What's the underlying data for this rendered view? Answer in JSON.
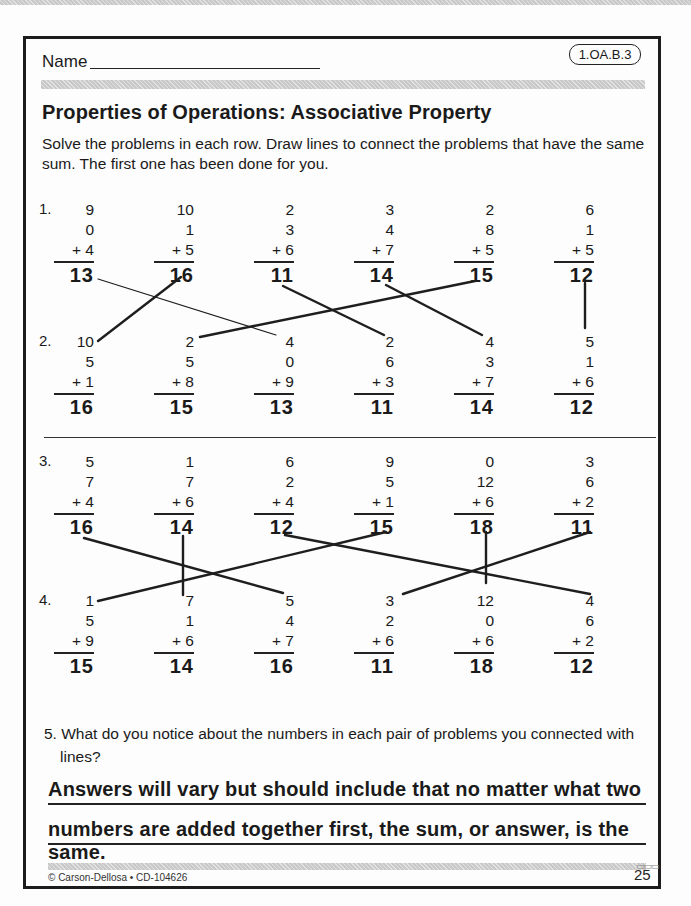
{
  "header": {
    "name_label": "Name",
    "standard_badge": "1.OA.B.3"
  },
  "title": "Properties of Operations: Associative Property",
  "instructions": {
    "line1": "Solve the problems in each row. Draw lines to connect the problems that have the same",
    "line2": "sum. The first one has been done for you."
  },
  "rows": [
    {
      "label": "1.",
      "problems": [
        {
          "a": "9",
          "b": "0",
          "c": "+ 4",
          "sum": "13"
        },
        {
          "a": "10",
          "b": "1",
          "c": "+ 5",
          "sum": "16"
        },
        {
          "a": "2",
          "b": "3",
          "c": "+ 6",
          "sum": "11"
        },
        {
          "a": "3",
          "b": "4",
          "c": "+ 7",
          "sum": "14"
        },
        {
          "a": "2",
          "b": "8",
          "c": "+ 5",
          "sum": "15"
        },
        {
          "a": "6",
          "b": "1",
          "c": "+ 5",
          "sum": "12"
        }
      ]
    },
    {
      "label": "2.",
      "problems": [
        {
          "a": "10",
          "b": "5",
          "c": "+ 1",
          "sum": "16"
        },
        {
          "a": "2",
          "b": "5",
          "c": "+ 8",
          "sum": "15"
        },
        {
          "a": "4",
          "b": "0",
          "c": "+ 9",
          "sum": "13"
        },
        {
          "a": "2",
          "b": "6",
          "c": "+ 3",
          "sum": "11"
        },
        {
          "a": "4",
          "b": "3",
          "c": "+ 7",
          "sum": "14"
        },
        {
          "a": "5",
          "b": "1",
          "c": "+ 6",
          "sum": "12"
        }
      ]
    },
    {
      "label": "3.",
      "problems": [
        {
          "a": "5",
          "b": "7",
          "c": "+ 4",
          "sum": "16"
        },
        {
          "a": "1",
          "b": "7",
          "c": "+ 6",
          "sum": "14"
        },
        {
          "a": "6",
          "b": "2",
          "c": "+ 4",
          "sum": "12"
        },
        {
          "a": "9",
          "b": "5",
          "c": "+ 1",
          "sum": "15"
        },
        {
          "a": "0",
          "b": "12",
          "c": "+ 6",
          "sum": "18"
        },
        {
          "a": "3",
          "b": "6",
          "c": "+ 2",
          "sum": "11"
        }
      ]
    },
    {
      "label": "4.",
      "problems": [
        {
          "a": "1",
          "b": "5",
          "c": "+ 9",
          "sum": "15"
        },
        {
          "a": "7",
          "b": "1",
          "c": "+ 6",
          "sum": "14"
        },
        {
          "a": "5",
          "b": "4",
          "c": "+ 7",
          "sum": "16"
        },
        {
          "a": "3",
          "b": "2",
          "c": "+ 6",
          "sum": "11"
        },
        {
          "a": "12",
          "b": "0",
          "c": "+ 6",
          "sum": "18"
        },
        {
          "a": "4",
          "b": "6",
          "c": "+ 2",
          "sum": "12"
        }
      ]
    }
  ],
  "connections": {
    "rows_1_2": [
      {
        "from": "13",
        "to": "13",
        "x1": 98,
        "y1": 279,
        "x2": 276,
        "y2": 335,
        "width": 1.2
      },
      {
        "from": "16",
        "to": "16",
        "x1": 181,
        "y1": 277,
        "x2": 98,
        "y2": 341,
        "width": 2.4
      },
      {
        "from": "11",
        "to": "11",
        "x1": 283,
        "y1": 286,
        "x2": 384,
        "y2": 335,
        "width": 2.4
      },
      {
        "from": "14",
        "to": "14",
        "x1": 386,
        "y1": 285,
        "x2": 482,
        "y2": 335,
        "width": 2.4
      },
      {
        "from": "15",
        "to": "15",
        "x1": 475,
        "y1": 281,
        "x2": 200,
        "y2": 337,
        "width": 2.4
      },
      {
        "from": "12",
        "to": "12",
        "x1": 585,
        "y1": 283,
        "x2": 585,
        "y2": 328,
        "width": 2.4
      }
    ],
    "rows_3_4": [
      {
        "from": "16",
        "to": "16",
        "x1": 84,
        "y1": 538,
        "x2": 283,
        "y2": 593,
        "width": 2.4
      },
      {
        "from": "14",
        "to": "14",
        "x1": 183,
        "y1": 536,
        "x2": 183,
        "y2": 595,
        "width": 2.4
      },
      {
        "from": "15",
        "to": "15",
        "x1": 386,
        "y1": 532,
        "x2": 98,
        "y2": 601,
        "width": 2.4
      },
      {
        "from": "12",
        "to": "12",
        "x1": 285,
        "y1": 535,
        "x2": 590,
        "y2": 594,
        "width": 2.4
      },
      {
        "from": "18",
        "to": "18",
        "x1": 486,
        "y1": 532,
        "x2": 486,
        "y2": 583,
        "width": 2.4
      },
      {
        "from": "11",
        "to": "11",
        "x1": 590,
        "y1": 532,
        "x2": 403,
        "y2": 594,
        "width": 2.4
      }
    ]
  },
  "question5": {
    "line1": "5. What do you notice about the numbers in each pair of problems you connected with",
    "line2": "lines?",
    "answer_line1": "Answers will vary but should include that no matter what two",
    "answer_line2": "numbers are added together first, the sum, or answer, is the same."
  },
  "footer": {
    "copyright": "© Carson-Dellosa • CD-104626",
    "page_number": "25"
  }
}
